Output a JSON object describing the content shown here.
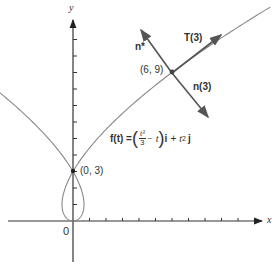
{
  "figure": {
    "axes": {
      "x_label": "x",
      "y_label": "y",
      "origin_label": "0",
      "x_ticks": [
        1,
        2,
        3,
        4,
        5,
        6,
        7,
        8,
        9,
        10
      ],
      "y_ticks": [
        1,
        2,
        3,
        4,
        5,
        6,
        7,
        8,
        9,
        10,
        11
      ],
      "color": "#333333"
    },
    "curve": {
      "formula_lhs": "f(t) =",
      "formula_frac_num": "t³",
      "formula_frac_den": "3",
      "formula_mid": "− t",
      "formula_i": "i",
      "formula_plus": "+",
      "formula_t": "t",
      "formula_exp": "2",
      "formula_j": "j",
      "x_of_t": "t^3/3 - t",
      "y_of_t": "t^2",
      "t_range": [
        -3.35,
        3.6
      ],
      "color": "#888888"
    },
    "points": [
      {
        "label": "(0, 3)",
        "x": 0,
        "y": 3
      },
      {
        "label": "(6, 9)",
        "x": 6,
        "y": 9
      }
    ],
    "vectors": {
      "tangent_label": "T(3)",
      "normal_label": "n(3)",
      "normal_star_label": "n*",
      "color": "#666666"
    }
  }
}
